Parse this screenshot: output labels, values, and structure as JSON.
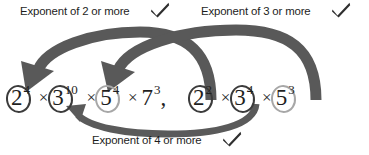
{
  "diagram": {
    "colors": {
      "arrow": "#595959",
      "arrow_thin": "#5a5a5a",
      "ring_dark": "#3b3b3b",
      "ring_light": "#a7a7a7",
      "text": "#1d1d1d",
      "check": "#2f2f2f",
      "background": "#ffffff"
    },
    "annotations": [
      {
        "id": "top-left",
        "text": "Exponent of 2 or more",
        "check_icon": "check-icon"
      },
      {
        "id": "top-right",
        "text": "Exponent of 3 or more",
        "check_icon": "check-icon"
      },
      {
        "id": "bottom",
        "text": "Exponent of 4 or more",
        "check_icon": "check-icon"
      }
    ],
    "expressions": [
      {
        "id": "left",
        "terms": [
          {
            "base": "2",
            "exponent": "4",
            "circled": true,
            "circle_style": "dark"
          },
          {
            "base": "3",
            "exponent": "10",
            "circled": true,
            "circle_style": "dark"
          },
          {
            "base": "5",
            "exponent": "4",
            "circled": true,
            "circle_style": "light"
          },
          {
            "base": "7",
            "exponent": "3",
            "circled": false,
            "circle_style": "none"
          }
        ],
        "operator": "×",
        "trailing": ","
      },
      {
        "id": "right",
        "terms": [
          {
            "base": "2",
            "exponent": "2",
            "circled": true,
            "circle_style": "dark"
          },
          {
            "base": "3",
            "exponent": "4",
            "circled": true,
            "circle_style": "dark"
          },
          {
            "base": "5",
            "exponent": "3",
            "circled": true,
            "circle_style": "light"
          }
        ],
        "operator": "×",
        "trailing": ""
      }
    ],
    "arrows": [
      {
        "id": "arrow-2-to-left",
        "from": "right 2",
        "to": "left 2",
        "label": "Exponent of 2 or more",
        "style": "thick-curved-arrow"
      },
      {
        "id": "arrow-5-to-left",
        "from": "right 5",
        "to": "left 5",
        "label": "Exponent of 3 or more",
        "style": "thick-curved-arrow"
      },
      {
        "id": "arrow-3-to-left",
        "from": "right 3",
        "to": "left 3",
        "label": "Exponent of 4 or more",
        "style": "thin-curved-arrow"
      }
    ]
  }
}
